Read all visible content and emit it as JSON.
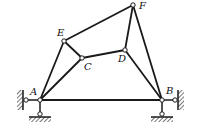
{
  "diagram": {
    "type": "planar-linkage-mechanism",
    "colors": {
      "stroke": "#1a1a1a",
      "joint_fill": "#ffffff",
      "background": "#ffffff"
    },
    "joints": [
      {
        "id": "A",
        "label": "A",
        "x": 40,
        "y": 100,
        "label_dx": -10,
        "label_dy": -5
      },
      {
        "id": "B",
        "label": "B",
        "x": 162,
        "y": 100,
        "label_dx": 4,
        "label_dy": -6
      },
      {
        "id": "C",
        "label": "C",
        "x": 82,
        "y": 58,
        "label_dx": 2,
        "label_dy": 12
      },
      {
        "id": "D",
        "label": "D",
        "x": 125,
        "y": 50,
        "label_dx": -7,
        "label_dy": 12
      },
      {
        "id": "E",
        "label": "E",
        "x": 64,
        "y": 41,
        "label_dx": -7,
        "label_dy": -5
      },
      {
        "id": "F",
        "label": "F",
        "x": 133,
        "y": 5,
        "label_dx": 6,
        "label_dy": 4
      }
    ],
    "links": [
      [
        "A",
        "B"
      ],
      [
        "A",
        "E"
      ],
      [
        "A",
        "C"
      ],
      [
        "E",
        "C"
      ],
      [
        "E",
        "F"
      ],
      [
        "C",
        "D"
      ],
      [
        "D",
        "F"
      ],
      [
        "D",
        "B"
      ],
      [
        "F",
        "B"
      ]
    ],
    "supports": [
      {
        "name": "A-wall",
        "pin_x": 26,
        "pin_y": 100,
        "attach": "A",
        "wall": "left"
      },
      {
        "name": "A-ground",
        "pin_x": 40,
        "pin_y": 114,
        "attach": "A",
        "wall": "bottom"
      },
      {
        "name": "B-wall",
        "pin_x": 175,
        "pin_y": 100,
        "attach": "B",
        "wall": "right"
      },
      {
        "name": "B-ground",
        "pin_x": 162,
        "pin_y": 114,
        "attach": "B",
        "wall": "bottom"
      }
    ]
  }
}
